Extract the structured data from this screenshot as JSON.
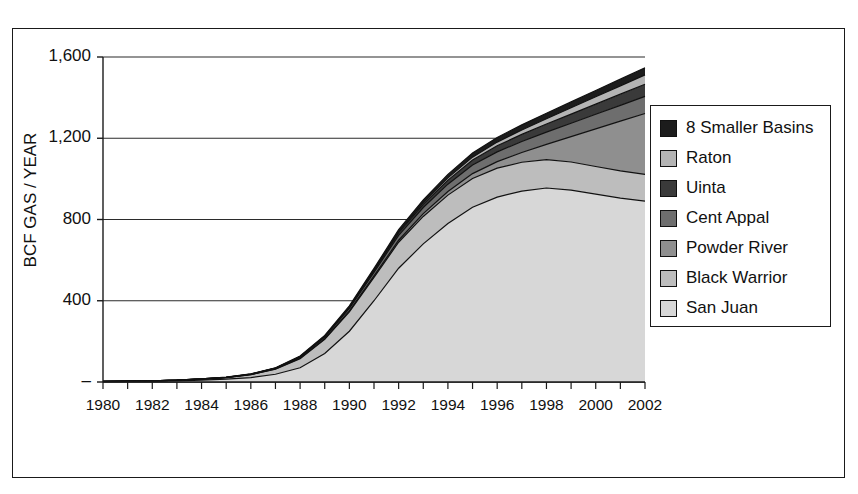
{
  "chart_title": "",
  "axes": {
    "ylabel": "BCF GAS / YEAR",
    "xlabel": "",
    "yticks": [
      "1,600",
      "1,200",
      "800",
      "400",
      "–"
    ],
    "ytick_values": [
      1600,
      1200,
      800,
      400,
      0
    ],
    "xticks": [
      "1980",
      "1982",
      "1984",
      "1986",
      "1988",
      "1990",
      "1992",
      "1994",
      "1996",
      "1998",
      "2000",
      "2002"
    ]
  },
  "legend": {
    "position": "right",
    "entries": [
      {
        "label": "8 Smaller Basins",
        "color": "#1c1c1c"
      },
      {
        "label": "Raton",
        "color": "#b4b4b4"
      },
      {
        "label": "Uinta",
        "color": "#3a3a3a"
      },
      {
        "label": "Cent Appal",
        "color": "#6e6e6e"
      },
      {
        "label": "Powder River",
        "color": "#8f8f8f"
      },
      {
        "label": "Black Warrior",
        "color": "#bdbdbd"
      },
      {
        "label": "San Juan",
        "color": "#d7d7d7"
      }
    ]
  },
  "chart_data": {
    "type": "area",
    "title": "",
    "xlabel": "",
    "ylabel": "BCF GAS / YEAR",
    "ylim": [
      0,
      1600
    ],
    "xlim": [
      1980,
      2002
    ],
    "grid": true,
    "stacked": true,
    "stack_order_bottom_to_top": [
      "San Juan",
      "Black Warrior",
      "Powder River",
      "Cent Appal",
      "Uinta",
      "Raton",
      "8 Smaller Basins"
    ],
    "x": [
      1980,
      1981,
      1982,
      1983,
      1984,
      1985,
      1986,
      1987,
      1988,
      1989,
      1990,
      1991,
      1992,
      1993,
      1994,
      1995,
      1996,
      1997,
      1998,
      1999,
      2000,
      2001,
      2002
    ],
    "series": [
      {
        "name": "San Juan",
        "color": "#d7d7d7",
        "values": [
          2,
          3,
          4,
          6,
          9,
          14,
          22,
          38,
          70,
          140,
          250,
          400,
          560,
          680,
          780,
          860,
          910,
          940,
          955,
          945,
          925,
          905,
          890
        ]
      },
      {
        "name": "Black Warrior",
        "color": "#bdbdbd",
        "values": [
          1,
          1,
          2,
          3,
          5,
          8,
          14,
          25,
          45,
          70,
          95,
          115,
          128,
          135,
          140,
          142,
          143,
          142,
          140,
          138,
          136,
          134,
          132
        ]
      },
      {
        "name": "Powder River",
        "color": "#8f8f8f",
        "values": [
          0,
          0,
          0,
          0,
          0,
          0,
          0,
          1,
          2,
          3,
          5,
          7,
          10,
          14,
          18,
          24,
          32,
          48,
          75,
          125,
          185,
          245,
          300
        ]
      },
      {
        "name": "Cent Appal",
        "color": "#6e6e6e",
        "values": [
          0,
          0,
          0,
          0,
          1,
          1,
          2,
          3,
          5,
          8,
          12,
          18,
          24,
          30,
          36,
          42,
          48,
          54,
          60,
          66,
          72,
          78,
          84
        ]
      },
      {
        "name": "Uinta",
        "color": "#3a3a3a",
        "values": [
          0,
          0,
          0,
          0,
          0,
          0,
          1,
          1,
          2,
          3,
          5,
          8,
          12,
          16,
          20,
          25,
          30,
          35,
          40,
          45,
          50,
          55,
          60
        ]
      },
      {
        "name": "Raton",
        "color": "#b4b4b4",
        "values": [
          0,
          0,
          0,
          0,
          0,
          0,
          0,
          0,
          1,
          1,
          2,
          3,
          5,
          8,
          11,
          14,
          18,
          22,
          26,
          31,
          36,
          41,
          46
        ]
      },
      {
        "name": "8 Smaller Basins",
        "color": "#1c1c1c",
        "values": [
          0,
          0,
          0,
          0,
          0,
          1,
          1,
          2,
          3,
          4,
          6,
          8,
          11,
          14,
          17,
          20,
          23,
          25,
          27,
          29,
          31,
          33,
          35
        ]
      }
    ]
  }
}
